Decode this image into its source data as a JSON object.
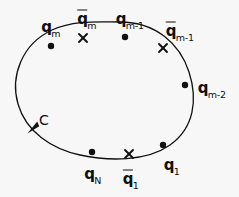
{
  "figure": {
    "background_color": "#f7f7f8",
    "ink_color": "#111111",
    "width": 239,
    "height": 197
  },
  "contour": {
    "name": "C",
    "label": "C",
    "label_x": 44,
    "label_y": 120,
    "orientation": "counterclockwise",
    "closed": true,
    "arrow_x": 33,
    "arrow_y": 125,
    "path": "M 120 22 C 156 22 180 44 189 72 C 198 100 194 128 170 145 C 146 162 108 161 80 155 C 52 149 26 132 18 104 C 10 76 22 44 52 30 C 74 20 98 22 120 22"
  },
  "markers": [
    {
      "id": "q-m",
      "type": "dot",
      "x": 51,
      "y": 46,
      "label_base": "q",
      "label_sub": "m",
      "barred": false,
      "label_x": 51,
      "label_y": 27
    },
    {
      "id": "qbar-m",
      "type": "cross",
      "x": 83,
      "y": 38,
      "label_base": "q",
      "label_sub": "m",
      "barred": true,
      "label_x": 87,
      "label_y": 18
    },
    {
      "id": "q-m-1",
      "type": "dot",
      "x": 125,
      "y": 37,
      "label_base": "q",
      "label_sub": "m-1",
      "barred": false,
      "label_x": 130,
      "label_y": 19
    },
    {
      "id": "qbar-m-1",
      "type": "cross",
      "x": 163,
      "y": 48,
      "label_base": "q",
      "label_sub": "m-1",
      "barred": true,
      "label_x": 180,
      "label_y": 30
    },
    {
      "id": "q-m-2",
      "type": "dot",
      "x": 185,
      "y": 85,
      "label_base": "q",
      "label_sub": "m-2",
      "barred": false,
      "label_x": 212,
      "label_y": 88
    },
    {
      "id": "q-1",
      "type": "dot",
      "x": 163,
      "y": 145,
      "label_base": "q",
      "label_sub": "1",
      "barred": false,
      "label_x": 172,
      "label_y": 165
    },
    {
      "id": "qbar-1",
      "type": "cross",
      "x": 129,
      "y": 154,
      "label_base": "q",
      "label_sub": "1",
      "barred": true,
      "label_x": 131,
      "label_y": 178
    },
    {
      "id": "q-N",
      "type": "dot",
      "x": 92,
      "y": 152,
      "label_base": "q",
      "label_sub": "N",
      "barred": false,
      "label_x": 93,
      "label_y": 174
    }
  ]
}
